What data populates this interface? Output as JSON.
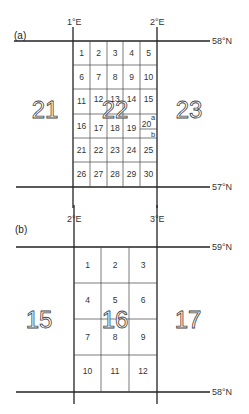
{
  "panel_a": {
    "label": "(a)",
    "lon_left": "1°E",
    "lon_right": "2°E",
    "lat_top": "58°N",
    "lat_bottom": "57°N",
    "quad_left": "21",
    "quad_center": "22",
    "quad_right": "23",
    "blocks": [
      "1",
      "2",
      "3",
      "4",
      "5",
      "6",
      "7",
      "8",
      "9",
      "10",
      "11",
      "12",
      "13",
      "14",
      "15",
      "16",
      "17",
      "18",
      "19",
      "20",
      "21",
      "22",
      "23",
      "24",
      "25",
      "26",
      "27",
      "28",
      "29",
      "30"
    ],
    "sub_a": "a",
    "sub_b": "b"
  },
  "panel_b": {
    "label": "(b)",
    "lon_left": "2°E",
    "lon_right": "3°E",
    "lat_top": "59°N",
    "lat_bottom": "58°N",
    "quad_left": "15",
    "quad_center": "16",
    "quad_right": "17",
    "blocks": [
      "1",
      "2",
      "3",
      "4",
      "5",
      "6",
      "7",
      "8",
      "9",
      "10",
      "11",
      "12"
    ]
  }
}
